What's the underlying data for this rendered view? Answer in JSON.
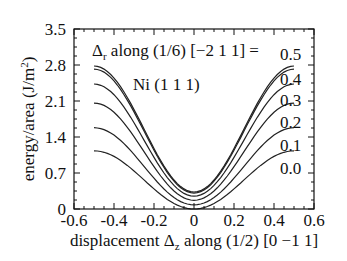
{
  "chart_data": {
    "type": "line",
    "title": "",
    "xlabel": "displacement Δz along (1/2) [0 −1  1]",
    "xlabel_parts": {
      "main": "displacement Δ",
      "sub": "z",
      "rest": " along (1/2) [0 −1  1]"
    },
    "ylabel": "energy/area (J/m²)",
    "ylabel_parts": {
      "main": "energy/area (J/m",
      "sup": "2",
      "rest": ")"
    },
    "xlim": [
      -0.6,
      0.6
    ],
    "ylim": [
      0,
      3.5
    ],
    "xticks": [
      "-0.6",
      "-0.4",
      "-0.2",
      "0",
      "0.2",
      "0.4",
      "0.6"
    ],
    "xtick_values": [
      -0.6,
      -0.4,
      -0.2,
      0,
      0.2,
      0.4,
      0.6
    ],
    "yticks": [
      "0",
      "0.7",
      "1.4",
      "2.1",
      "2.8",
      "3.5"
    ],
    "ytick_values": [
      0,
      0.7,
      1.4,
      2.1,
      2.8,
      3.5
    ],
    "grid": false,
    "annotations": {
      "legend_title_main": "Δ",
      "legend_title_sub": "r",
      "legend_title_rest": " along (1/6) [−2 1 1] =",
      "material": "Ni  (1 1 1)"
    },
    "series_labels": [
      "0.5",
      "0.4",
      "0.3",
      "0.2",
      "0.1",
      "0.0"
    ],
    "series": [
      {
        "name": "0.5",
        "x_range": [
          -0.5,
          0.5
        ],
        "max": 2.78,
        "min": 0.33
      },
      {
        "name": "0.4",
        "x_range": [
          -0.5,
          0.5
        ],
        "max": 2.72,
        "min": 0.31
      },
      {
        "name": "0.3",
        "x_range": [
          -0.5,
          0.5
        ],
        "max": 2.43,
        "min": 0.25
      },
      {
        "name": "0.2",
        "x_range": [
          -0.5,
          0.5
        ],
        "max": 2.06,
        "min": 0.17
      },
      {
        "name": "0.1",
        "x_range": [
          -0.5,
          0.5
        ],
        "max": 1.58,
        "min": 0.08
      },
      {
        "name": "0.0",
        "x_range": [
          -0.5,
          0.5
        ],
        "max": 1.13,
        "min": 0.0
      }
    ]
  }
}
